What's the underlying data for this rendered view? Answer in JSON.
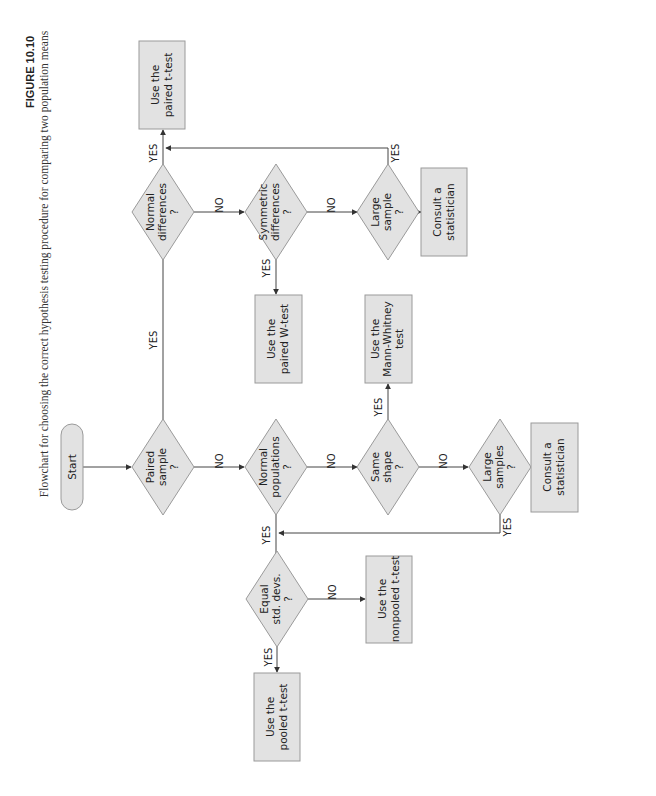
{
  "caption": {
    "figure_label": "FIGURE 10.10",
    "text": "Flowchart for choosing the correct hypothesis testing procedure for comparing two population means"
  },
  "nodes": {
    "start": {
      "label": [
        "Start"
      ]
    },
    "paired_sample": {
      "label": [
        "Paired",
        "sample",
        "?"
      ]
    },
    "normal_differences": {
      "label": [
        "Normal",
        "differences",
        "?"
      ]
    },
    "symmetric_differences": {
      "label": [
        "Symmetric",
        "differences",
        "?"
      ]
    },
    "large_sample": {
      "label": [
        "Large",
        "sample",
        "?"
      ]
    },
    "consult_top": {
      "label": [
        "Consult a",
        "statistician"
      ]
    },
    "paired_t": {
      "label": [
        "Use the",
        "paired t-test"
      ]
    },
    "paired_w": {
      "label": [
        "Use the",
        "paired W-test"
      ]
    },
    "normal_populations": {
      "label": [
        "Normal",
        "populations",
        "?"
      ]
    },
    "mann_whitney": {
      "label": [
        "Use the",
        "Mann-Whitney",
        "test"
      ]
    },
    "same_shape": {
      "label": [
        "Same",
        "shape",
        "?"
      ]
    },
    "large_samples": {
      "label": [
        "Large",
        "samples",
        "?"
      ]
    },
    "consult_bottom": {
      "label": [
        "Consult a",
        "statistician"
      ]
    },
    "equal_std": {
      "label": [
        "Equal",
        "std. devs.",
        "?"
      ]
    },
    "nonpooled_t": {
      "label": [
        "Use the",
        "nonpooled t-test"
      ]
    },
    "pooled_t": {
      "label": [
        "Use the",
        "pooled t-test"
      ]
    }
  },
  "edge_labels": {
    "yes": "YES",
    "no": "NO"
  },
  "colors": {
    "shape_fill": "#e2e2e2",
    "shape_stroke": "#9a9a9a",
    "line": "#444444"
  }
}
